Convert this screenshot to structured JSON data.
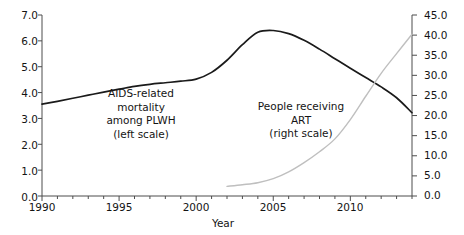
{
  "chart_data": {
    "type": "line",
    "title": "",
    "xlabel": "Year",
    "ylabel": "",
    "grid": false,
    "legend_position": "inline-annotations",
    "xlim": [
      1990,
      2014
    ],
    "x_ticks": [
      "1990",
      "1995",
      "2000",
      "2005",
      "2010"
    ],
    "x_tick_values": [
      1990,
      1995,
      2000,
      2005,
      2010
    ],
    "x_minor_tick_step": 1,
    "left_axis": {
      "label": "",
      "ylim": [
        0.0,
        7.0
      ],
      "ticks": [
        "0.0",
        "1.0",
        "2.0",
        "3.0",
        "4.0",
        "5.0",
        "6.0",
        "7.0"
      ],
      "tick_values": [
        0.0,
        1.0,
        2.0,
        3.0,
        4.0,
        5.0,
        6.0,
        7.0
      ]
    },
    "right_axis": {
      "label": "",
      "ylim": [
        0.0,
        45.0
      ],
      "ticks": [
        "0.0",
        "5.0",
        "10.0",
        "15.0",
        "20.0",
        "25.0",
        "30.0",
        "35.0",
        "40.0",
        "45.0"
      ],
      "tick_values": [
        0.0,
        5.0,
        10.0,
        15.0,
        20.0,
        25.0,
        30.0,
        35.0,
        40.0,
        45.0
      ]
    },
    "series": [
      {
        "name": "AIDS-related mortality among PLWH",
        "annotation": "AIDS-related\nmortality\namong PLWH\n(left scale)",
        "axis": "left",
        "color": "#1a1a1a",
        "x": [
          1990,
          1991,
          1992,
          1993,
          1994,
          1995,
          1996,
          1997,
          1998,
          1999,
          2000,
          2001,
          2002,
          2003,
          2004,
          2005,
          2006,
          2007,
          2008,
          2009,
          2010,
          2011,
          2012,
          2013,
          2014
        ],
        "values": [
          3.55,
          3.66,
          3.78,
          3.9,
          4.02,
          4.13,
          4.24,
          4.32,
          4.38,
          4.44,
          4.52,
          4.78,
          5.25,
          5.85,
          6.33,
          6.4,
          6.28,
          6.02,
          5.68,
          5.31,
          4.94,
          4.58,
          4.22,
          3.8,
          3.22
        ]
      },
      {
        "name": "People receiving ART",
        "annotation": "People receiving\nART\n(right scale)",
        "axis": "right",
        "color": "#bfbfbf",
        "x": [
          2002,
          2003,
          2004,
          2005,
          2006,
          2007,
          2008,
          2009,
          2010,
          2011,
          2012,
          2013,
          2014
        ],
        "values": [
          2.4,
          2.8,
          3.3,
          4.3,
          6.0,
          8.3,
          11.0,
          14.2,
          19.0,
          24.8,
          30.5,
          35.4,
          40.2
        ]
      }
    ]
  },
  "annotations": {
    "left_series": {
      "line1": "AIDS-related",
      "line2": "mortality",
      "line3": "among PLWH",
      "line4": "(left scale)"
    },
    "right_series": {
      "line1": "People receiving",
      "line2": "ART",
      "line3": "(right scale)"
    }
  },
  "axis_titles": {
    "x": "Year"
  },
  "colors": {
    "mortality_line": "#1a1a1a",
    "art_line": "#bfbfbf",
    "axis": "#4d4d4d",
    "text": "#141414",
    "background": "#ffffff"
  }
}
